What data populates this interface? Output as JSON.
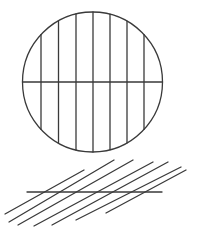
{
  "diagram": {
    "top_figure": {
      "shape": "circle",
      "horizontal_lines": 1,
      "vertical_lines": 7
    },
    "bottom_figure": {
      "shape": "parallel-lines",
      "diagonal_lines": 7,
      "horizontal_lines": 1
    },
    "stroke_color": "#3a3a3a",
    "background_color": "#ffffff"
  }
}
